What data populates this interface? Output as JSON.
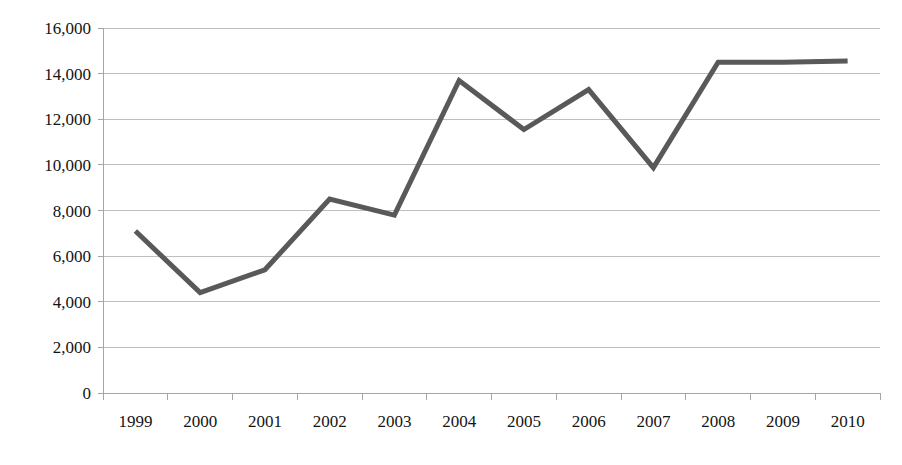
{
  "chart_data": {
    "type": "line",
    "title": "",
    "subtitle": "",
    "xlabel": "",
    "ylabel": "",
    "categories": [
      "1999",
      "2000",
      "2001",
      "2002",
      "2003",
      "2004",
      "2005",
      "2006",
      "2007",
      "2008",
      "2009",
      "2010"
    ],
    "series": [
      {
        "name": "",
        "color": "#595959",
        "values": [
          7100,
          4400,
          5400,
          8500,
          7800,
          13700,
          11550,
          13300,
          9880,
          14500,
          14500,
          14550
        ]
      }
    ],
    "ylim": [
      0,
      16000
    ],
    "y_ticks": [
      0,
      2000,
      4000,
      6000,
      8000,
      10000,
      12000,
      14000,
      16000
    ],
    "y_tick_labels": [
      "0",
      "2,000",
      "4,000",
      "6,000",
      "8,000",
      "10,000",
      "12,000",
      "14,000",
      "16,000"
    ],
    "x_tick_labels": [
      "1999",
      "2000",
      "2001",
      "2002",
      "2003",
      "2004",
      "2005",
      "2006",
      "2007",
      "2008",
      "2009",
      "2010"
    ],
    "grid": true,
    "grid_axis": "y",
    "legend": false,
    "legend_position": "none",
    "annotations": [],
    "colors": {
      "line": "#595959",
      "gridline": "#bfbfbf",
      "axis": "#a6a6a6",
      "text": "#141414",
      "background": "#ffffff"
    }
  }
}
